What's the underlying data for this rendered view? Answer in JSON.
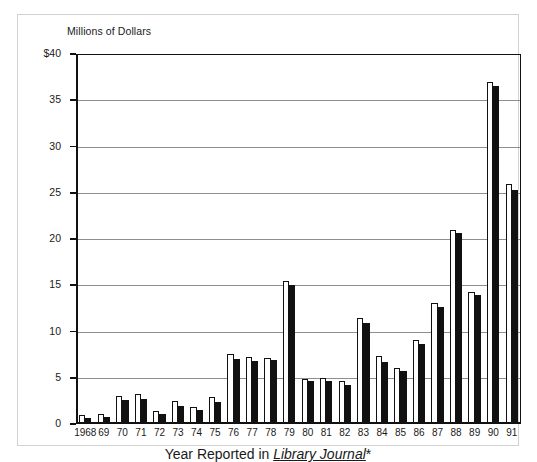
{
  "figure": {
    "y_axis_title": "Millions of Dollars",
    "x_axis_title_prefix": "Year Reported in ",
    "x_axis_title_journal": "Library Journal",
    "x_axis_title_suffix": "*"
  },
  "chart_data": {
    "type": "bar",
    "title": "",
    "subtitle": "",
    "xlabel": "Year Reported in Library Journal*",
    "ylabel": "Millions of Dollars",
    "ylim": [
      0,
      40
    ],
    "yticks": [
      0,
      5,
      10,
      15,
      20,
      25,
      30,
      35,
      40
    ],
    "ytick_labels": [
      "0",
      "5",
      "10",
      "15",
      "20",
      "25",
      "30",
      "35",
      "$40"
    ],
    "grid": "horizontal",
    "legend_position": "none",
    "categories": [
      "1968",
      "69",
      "70",
      "71",
      "72",
      "73",
      "74",
      "75",
      "76",
      "77",
      "78",
      "79",
      "80",
      "81",
      "82",
      "83",
      "84",
      "85",
      "86",
      "87",
      "88",
      "89",
      "90",
      "91"
    ],
    "series": [
      {
        "name": "light",
        "color": "#ffffff",
        "edge_color": "#111111",
        "values": [
          1.0,
          1.1,
          3.0,
          3.2,
          1.4,
          2.5,
          1.8,
          2.9,
          7.6,
          7.2,
          7.1,
          15.5,
          4.9,
          5.0,
          4.6,
          11.5,
          7.3,
          6.1,
          9.1,
          13.1,
          21.0,
          14.3,
          37.0,
          26.0
        ]
      },
      {
        "name": "dark",
        "color": "#111111",
        "edge_color": "#111111",
        "values": [
          0.6,
          0.8,
          2.6,
          2.7,
          1.1,
          2.0,
          1.5,
          2.4,
          7.0,
          6.8,
          6.9,
          15.0,
          4.6,
          4.7,
          4.2,
          10.9,
          6.7,
          5.7,
          8.6,
          12.6,
          20.6,
          13.9,
          36.5,
          25.3
        ]
      }
    ]
  }
}
